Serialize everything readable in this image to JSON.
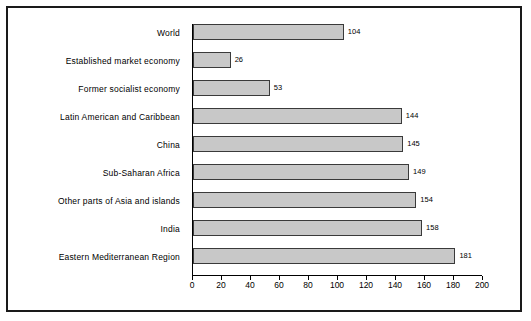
{
  "chart_data": {
    "type": "bar",
    "orientation": "horizontal",
    "title": "",
    "subtitle": "",
    "xlabel": "",
    "ylabel": "",
    "xlim": [
      0,
      200
    ],
    "xticks": [
      0,
      20,
      40,
      60,
      80,
      100,
      120,
      140,
      160,
      180,
      200
    ],
    "grid": false,
    "legend": null,
    "bar_color": "#c8c8c8",
    "bar_border_color": "#3a3a3a",
    "categories": [
      "World",
      "Established market economy",
      "Former socialist economy",
      "Latin American and Caribbean",
      "China",
      "Sub-Saharan Africa",
      "Other parts of Asia and islands",
      "India",
      "Eastern Mediterranean Region"
    ],
    "values": [
      104,
      26,
      53,
      144,
      145,
      149,
      154,
      158,
      181
    ],
    "value_labels": [
      "104",
      "26",
      "53",
      "144",
      "145",
      "149",
      "154",
      "158",
      "181"
    ]
  },
  "axis_caption": ""
}
